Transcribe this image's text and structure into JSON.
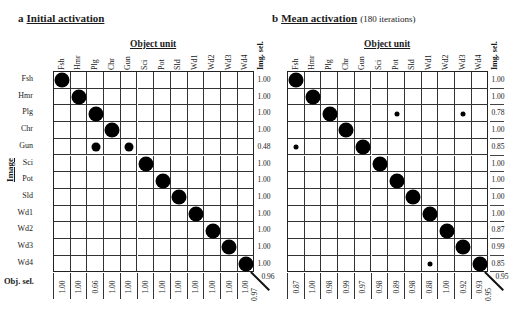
{
  "labels": [
    "Fsh",
    "Hmr",
    "Plg",
    "Chr",
    "Gun",
    "Sci",
    "Pot",
    "Sld",
    "Wd1",
    "Wd2",
    "Wd3",
    "Wd4"
  ],
  "axis": {
    "object_unit": "Object unit",
    "image": "Image",
    "img_sel": "Img. sel.",
    "obj_sel": "Obj. sel."
  },
  "panels": [
    {
      "letter": "a",
      "title": "Initial activation",
      "subtitle": "",
      "img_sel": [
        "1.00",
        "1.00",
        "1.00",
        "1.00",
        "0.48",
        "1.00",
        "1.00",
        "1.00",
        "1.00",
        "1.00",
        "1.00",
        "1.00"
      ],
      "obj_sel": [
        "1.00",
        "1.00",
        "0.66",
        "1.00",
        "1.00",
        "1.00",
        "1.00",
        "1.00",
        "1.00",
        "1.00",
        "1.00",
        "1.00"
      ],
      "corner_right": "0.96",
      "corner_bottom": "0.97",
      "dots": [
        {
          "r": 0,
          "c": 0,
          "s": "L"
        },
        {
          "r": 1,
          "c": 1,
          "s": "L"
        },
        {
          "r": 2,
          "c": 2,
          "s": "L"
        },
        {
          "r": 3,
          "c": 3,
          "s": "L"
        },
        {
          "r": 4,
          "c": 2,
          "s": "M"
        },
        {
          "r": 4,
          "c": 4,
          "s": "M"
        },
        {
          "r": 5,
          "c": 5,
          "s": "L"
        },
        {
          "r": 6,
          "c": 6,
          "s": "L"
        },
        {
          "r": 7,
          "c": 7,
          "s": "L"
        },
        {
          "r": 8,
          "c": 8,
          "s": "L"
        },
        {
          "r": 9,
          "c": 9,
          "s": "L"
        },
        {
          "r": 10,
          "c": 10,
          "s": "L"
        },
        {
          "r": 11,
          "c": 11,
          "s": "L"
        }
      ]
    },
    {
      "letter": "b",
      "title": "Mean activation",
      "subtitle": "(180 iterations)",
      "img_sel": [
        "1.00",
        "1.00",
        "0.78",
        "1.00",
        "0.85",
        "1.00",
        "1.00",
        "1.00",
        "1.00",
        "0.87",
        "0.99",
        "0.85"
      ],
      "obj_sel": [
        "0.87",
        "1.00",
        "0.98",
        "0.99",
        "0.97",
        "0.98",
        "0.89",
        "0.98",
        "0.88",
        "1.00",
        "0.92",
        "0.93"
      ],
      "corner_right": "0.95",
      "corner_bottom": "0.95",
      "dots": [
        {
          "r": 0,
          "c": 0,
          "s": "L"
        },
        {
          "r": 1,
          "c": 1,
          "s": "L"
        },
        {
          "r": 2,
          "c": 2,
          "s": "L"
        },
        {
          "r": 2,
          "c": 6,
          "s": "S"
        },
        {
          "r": 2,
          "c": 10,
          "s": "S"
        },
        {
          "r": 3,
          "c": 3,
          "s": "L"
        },
        {
          "r": 4,
          "c": 0,
          "s": "S"
        },
        {
          "r": 4,
          "c": 4,
          "s": "L"
        },
        {
          "r": 5,
          "c": 5,
          "s": "L"
        },
        {
          "r": 6,
          "c": 6,
          "s": "L"
        },
        {
          "r": 7,
          "c": 7,
          "s": "L"
        },
        {
          "r": 8,
          "c": 8,
          "s": "L"
        },
        {
          "r": 9,
          "c": 9,
          "s": "L"
        },
        {
          "r": 10,
          "c": 10,
          "s": "L"
        },
        {
          "r": 11,
          "c": 8,
          "s": "S"
        },
        {
          "r": 11,
          "c": 11,
          "s": "L"
        }
      ]
    }
  ]
}
